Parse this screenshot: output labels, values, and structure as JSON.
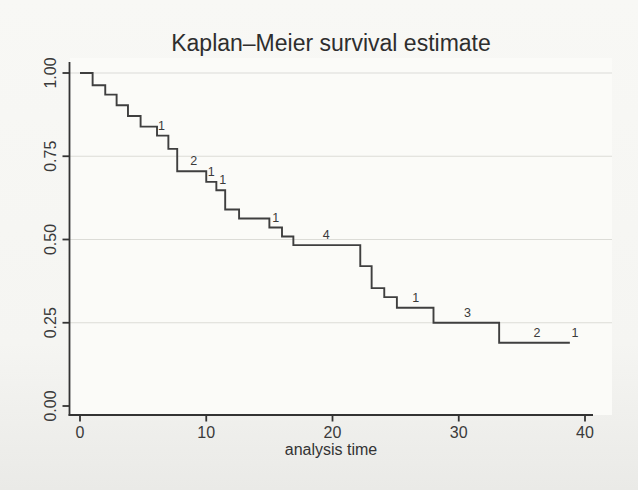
{
  "chart_data": {
    "type": "line",
    "subtype": "kaplan-meier-step-function",
    "title": "Kaplan–Meier survival estimate",
    "xlabel": "analysis time",
    "ylabel": "",
    "xlim": [
      0,
      40
    ],
    "ylim": [
      0.0,
      1.0
    ],
    "xticks": [
      0,
      10,
      20,
      30,
      40
    ],
    "yticks": [
      0.0,
      0.25,
      0.5,
      0.75,
      1.0
    ],
    "ytick_labels": [
      "0.00",
      "0.25",
      "0.50",
      "0.75",
      "1.00"
    ],
    "grid": "horizontal at 0.25, 0.50, 0.75, 1.00",
    "legend": "none",
    "series": [
      {
        "name": "survival estimate",
        "draw": "step",
        "points": [
          [
            0.0,
            1.0
          ],
          [
            1.0,
            0.963
          ],
          [
            2.0,
            0.935
          ],
          [
            2.9,
            0.903
          ],
          [
            3.8,
            0.871
          ],
          [
            4.8,
            0.839
          ],
          [
            6.1,
            0.812
          ],
          [
            7.0,
            0.772
          ],
          [
            7.7,
            0.705
          ],
          [
            10.0,
            0.673
          ],
          [
            10.8,
            0.648
          ],
          [
            11.5,
            0.59
          ],
          [
            12.6,
            0.563
          ],
          [
            15.0,
            0.536
          ],
          [
            16.0,
            0.509
          ],
          [
            16.9,
            0.483
          ],
          [
            22.2,
            0.42
          ],
          [
            23.1,
            0.354
          ],
          [
            24.1,
            0.327
          ],
          [
            25.1,
            0.295
          ],
          [
            28.0,
            0.25
          ],
          [
            33.2,
            0.19
          ]
        ],
        "end_time": 38.8
      }
    ],
    "censored_count_labels": [
      {
        "time": 6.45,
        "level": 0.812,
        "label": "1"
      },
      {
        "time": 9.0,
        "level": 0.705,
        "label": "2"
      },
      {
        "time": 10.4,
        "level": 0.673,
        "label": "1"
      },
      {
        "time": 11.3,
        "level": 0.648,
        "label": "1"
      },
      {
        "time": 15.5,
        "level": 0.536,
        "label": "1"
      },
      {
        "time": 19.5,
        "level": 0.483,
        "label": "4"
      },
      {
        "time": 26.6,
        "level": 0.295,
        "label": "1"
      },
      {
        "time": 30.7,
        "level": 0.25,
        "label": "3"
      },
      {
        "time": 36.2,
        "level": 0.19,
        "label": "2"
      },
      {
        "time": 39.2,
        "level": 0.19,
        "label": "1"
      }
    ]
  },
  "style": {
    "curve_color": "#3f3f3f",
    "axis_color": "#333333",
    "grid_color": "#dcdcd7",
    "text_color": "#3a3a3a",
    "plot_bg": "#fbfbf8"
  }
}
